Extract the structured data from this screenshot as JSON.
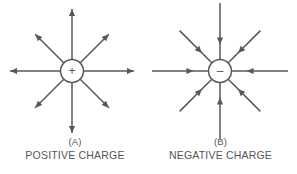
{
  "figure": {
    "background_color": "#ffffff",
    "stroke_color": "#58585c",
    "text_color": "#555558",
    "panels": [
      {
        "id": "panel-a",
        "key": "(A)",
        "title": "POSITIVE CHARGE",
        "charge_symbol": "+",
        "field_direction": "outward",
        "ray_count": 8,
        "center_x": 72,
        "center_y": 71,
        "circle_radius": 11.5,
        "ray_inner_radius": 12,
        "ray_outer_radius": 62,
        "arrowhead_position": "tip"
      },
      {
        "id": "panel-b",
        "key": "(B)",
        "title": "NEGATIVE CHARGE",
        "charge_symbol": "–",
        "field_direction": "inward",
        "ray_count": 8,
        "center_x": 220,
        "center_y": 71,
        "circle_radius": 11.5,
        "ray_inner_radius": 12,
        "ray_outer_radius": 68,
        "arrowhead_position": "inner"
      }
    ]
  }
}
